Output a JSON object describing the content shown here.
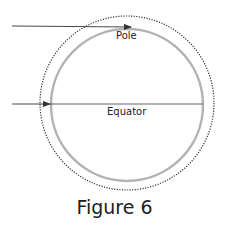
{
  "diagram": {
    "labels": {
      "pole": "Pole",
      "equator": "Equator"
    },
    "caption": "Figure 6",
    "colors": {
      "earth_circle": "#b3b3b3",
      "atmosphere_dotted": "#333333",
      "ray": "#333333"
    }
  }
}
